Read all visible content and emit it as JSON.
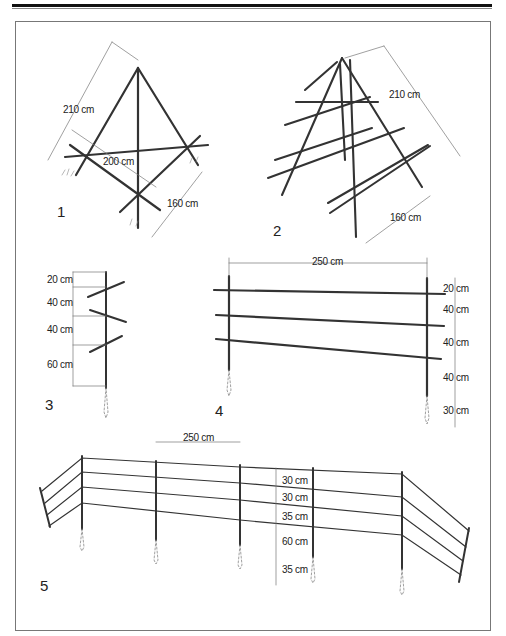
{
  "figures": [
    {
      "number": "1",
      "name": "tripod-trellis",
      "dimensions": {
        "leg_length": "210 cm",
        "cross_bar": "200 cm",
        "base_width": "160 cm"
      }
    },
    {
      "number": "2",
      "name": "a-frame-trellis",
      "dimensions": {
        "leg_length": "210 cm",
        "base_width": "160 cm"
      }
    },
    {
      "number": "3",
      "name": "single-post-crossbars",
      "dimensions": {
        "top": "20 cm",
        "gap1": "40 cm",
        "gap2": "40 cm",
        "bottom": "60 cm"
      }
    },
    {
      "number": "4",
      "name": "three-rail-fence-section",
      "dimensions": {
        "span": "250 cm",
        "top": "20 cm",
        "gap1": "40 cm",
        "gap2": "40 cm",
        "bottom": "40 cm",
        "buried": "30 cm"
      }
    },
    {
      "number": "5",
      "name": "four-wire-fence-run",
      "dimensions": {
        "span": "250 cm",
        "gap1": "30 cm",
        "gap2": "30 cm",
        "gap3": "35 cm",
        "bottom": "60 cm",
        "buried": "35 cm"
      }
    }
  ],
  "colors": {
    "line": "#333333",
    "dim": "#666666",
    "frame": "#777777",
    "rule": "#111111"
  }
}
